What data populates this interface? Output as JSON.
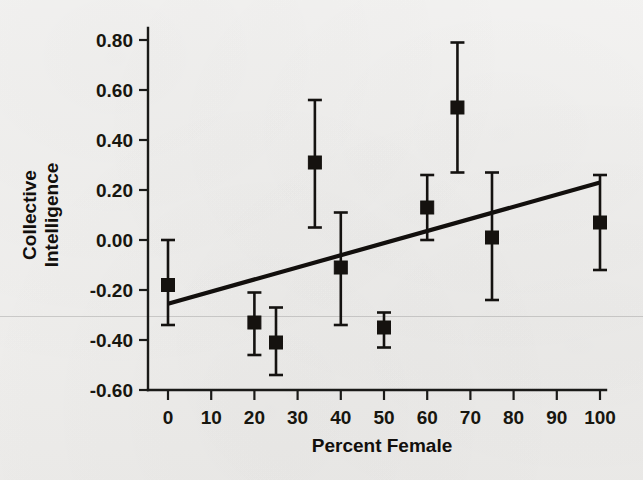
{
  "chart_data": {
    "type": "scatter",
    "title": "",
    "xlabel": "Percent Female",
    "ylabel": "Collective Intelligence",
    "xlim": [
      0,
      100
    ],
    "ylim": [
      -0.6,
      0.8
    ],
    "grid": false,
    "legend": "none",
    "x_ticks": [
      0,
      10,
      20,
      30,
      40,
      50,
      60,
      70,
      80,
      90,
      100
    ],
    "x_tick_labels": [
      "0",
      "10",
      "20",
      "30",
      "40",
      "50",
      "60",
      "70",
      "80",
      "90",
      "100"
    ],
    "y_ticks": [
      0.8,
      0.6,
      0.4,
      0.2,
      0.0,
      -0.2,
      -0.4,
      -0.6
    ],
    "y_tick_labels": [
      "0.80",
      "0.60",
      "0.40",
      "0.20",
      "0.00",
      "-0.20",
      "-0.40",
      "-0.60"
    ],
    "marker": "filled-square",
    "error_bars": "vertical",
    "points": [
      {
        "x": 0,
        "y": -0.18,
        "y_low": -0.34,
        "y_high": 0.0
      },
      {
        "x": 20,
        "y": -0.33,
        "y_low": -0.46,
        "y_high": -0.21
      },
      {
        "x": 25,
        "y": -0.41,
        "y_low": -0.54,
        "y_high": -0.27
      },
      {
        "x": 34,
        "y": 0.31,
        "y_low": 0.05,
        "y_high": 0.56
      },
      {
        "x": 40,
        "y": -0.11,
        "y_low": -0.34,
        "y_high": 0.11
      },
      {
        "x": 50,
        "y": -0.35,
        "y_low": -0.43,
        "y_high": -0.29
      },
      {
        "x": 60,
        "y": 0.13,
        "y_low": 0.0,
        "y_high": 0.26
      },
      {
        "x": 67,
        "y": 0.53,
        "y_low": 0.27,
        "y_high": 0.79
      },
      {
        "x": 75,
        "y": 0.01,
        "y_low": -0.24,
        "y_high": 0.27
      },
      {
        "x": 100,
        "y": 0.07,
        "y_low": -0.12,
        "y_high": 0.26
      }
    ],
    "fit_line": {
      "label": "linear regression",
      "x_start": 0,
      "y_start": -0.255,
      "x_end": 100,
      "y_end": 0.23
    },
    "colors": {
      "marker": "#15120f",
      "fit_line": "#120f0d",
      "axis": "#1a1a18",
      "background": "#f0efed",
      "text": "#17160f"
    }
  },
  "axes": {
    "x_title": "Percent Female",
    "y_title_line1": "Collective",
    "y_title_line2": "Intelligence"
  }
}
